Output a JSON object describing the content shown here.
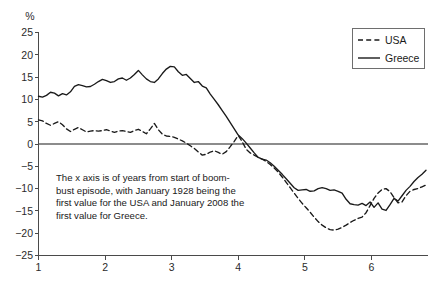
{
  "chart_data": {
    "type": "line",
    "title": "",
    "subtitle": "",
    "xlabel": "",
    "ylabel": "%",
    "unit_label": "%",
    "xlim": [
      1,
      6.85
    ],
    "ylim": [
      -25,
      25
    ],
    "grid": false,
    "zero_line": true,
    "legend_position": "top-right",
    "x_ticks": [
      "1",
      "2",
      "3",
      "4",
      "5",
      "6"
    ],
    "x_tick_values": [
      1,
      2,
      3,
      4,
      5,
      6
    ],
    "y_ticks": [
      "25",
      "20",
      "15",
      "10",
      "5",
      "0",
      "−5",
      "−10",
      "−15",
      "−20",
      "−25"
    ],
    "y_tick_values": [
      25,
      20,
      15,
      10,
      5,
      0,
      -5,
      -10,
      -15,
      -20,
      -25
    ],
    "annotation": "The x axis is of years from start of boom-bust episode, with January 1928 being the first value for the USA and January 2008 the first value for Greece.",
    "annotation_lines": [
      "The x axis is of years from start of boom-",
      "bust episode, with January 1928 being the",
      "first value for the USA and January 2008 the",
      "first value for Greece."
    ],
    "series": [
      {
        "name": "USA",
        "style": "dashed",
        "color": "#1a1a1a",
        "x": [
          1.0,
          1.06,
          1.12,
          1.18,
          1.24,
          1.3,
          1.36,
          1.42,
          1.48,
          1.54,
          1.6,
          1.66,
          1.72,
          1.78,
          1.84,
          1.9,
          1.96,
          2.02,
          2.08,
          2.14,
          2.2,
          2.26,
          2.32,
          2.38,
          2.44,
          2.5,
          2.56,
          2.62,
          2.68,
          2.74,
          2.8,
          2.86,
          2.92,
          2.98,
          3.04,
          3.1,
          3.16,
          3.22,
          3.28,
          3.34,
          3.4,
          3.46,
          3.52,
          3.58,
          3.64,
          3.7,
          3.76,
          3.82,
          3.88,
          3.94,
          4.0,
          4.06,
          4.12,
          4.18,
          4.24,
          4.3,
          4.36,
          4.42,
          4.48,
          4.54,
          4.6,
          4.66,
          4.72,
          4.78,
          4.84,
          4.9,
          4.96,
          5.02,
          5.08,
          5.14,
          5.2,
          5.26,
          5.32,
          5.38,
          5.44,
          5.5,
          5.56,
          5.62,
          5.68,
          5.74,
          5.8,
          5.86,
          5.92,
          5.98,
          6.04,
          6.1,
          6.16,
          6.22,
          6.28,
          6.34,
          6.4,
          6.46,
          6.52,
          6.58,
          6.64,
          6.7,
          6.76,
          6.82
        ],
        "values": [
          5.4,
          5.2,
          4.6,
          4.2,
          4.6,
          5.0,
          4.3,
          3.4,
          2.8,
          3.3,
          3.7,
          3.2,
          2.7,
          2.9,
          3.0,
          2.9,
          3.0,
          3.2,
          2.9,
          2.6,
          2.9,
          3.0,
          2.8,
          2.6,
          3.0,
          3.3,
          2.8,
          2.3,
          3.4,
          4.6,
          3.2,
          2.2,
          1.8,
          1.7,
          1.5,
          1.1,
          0.7,
          0.2,
          -0.4,
          -1.0,
          -1.8,
          -2.5,
          -2.3,
          -1.8,
          -1.5,
          -1.9,
          -2.3,
          -1.7,
          -0.6,
          0.6,
          1.9,
          0.5,
          -1.2,
          -2.0,
          -2.5,
          -3.0,
          -3.4,
          -3.9,
          -4.6,
          -5.4,
          -6.3,
          -7.4,
          -8.6,
          -9.8,
          -11.0,
          -12.2,
          -13.3,
          -14.3,
          -15.3,
          -16.4,
          -17.4,
          -18.2,
          -18.8,
          -19.2,
          -19.3,
          -19.1,
          -18.7,
          -18.2,
          -17.6,
          -17.1,
          -16.7,
          -16.4,
          -15.4,
          -13.8,
          -12.2,
          -11.0,
          -10.2,
          -10.0,
          -10.7,
          -12.0,
          -13.2,
          -13.0,
          -11.6,
          -10.6,
          -10.2,
          -10.0,
          -9.6,
          -9.2
        ]
      },
      {
        "name": "Greece",
        "style": "solid",
        "color": "#1a1a1a",
        "x": [
          1.0,
          1.06,
          1.12,
          1.18,
          1.24,
          1.3,
          1.36,
          1.42,
          1.48,
          1.54,
          1.6,
          1.66,
          1.72,
          1.78,
          1.84,
          1.9,
          1.96,
          2.02,
          2.08,
          2.14,
          2.2,
          2.26,
          2.32,
          2.38,
          2.44,
          2.5,
          2.56,
          2.62,
          2.68,
          2.74,
          2.8,
          2.86,
          2.92,
          2.98,
          3.04,
          3.1,
          3.16,
          3.22,
          3.28,
          3.34,
          3.4,
          3.46,
          3.52,
          3.58,
          3.64,
          3.7,
          3.76,
          3.82,
          3.88,
          3.94,
          4.0,
          4.06,
          4.12,
          4.18,
          4.24,
          4.3,
          4.36,
          4.42,
          4.48,
          4.54,
          4.6,
          4.66,
          4.72,
          4.78,
          4.84,
          4.9,
          4.96,
          5.02,
          5.08,
          5.14,
          5.2,
          5.26,
          5.32,
          5.38,
          5.44,
          5.5,
          5.56,
          5.62,
          5.68,
          5.74,
          5.8,
          5.86,
          5.92,
          5.98,
          6.04,
          6.1,
          6.16,
          6.22,
          6.28,
          6.34,
          6.4,
          6.46,
          6.52,
          6.58,
          6.64,
          6.7,
          6.76,
          6.82
        ],
        "values": [
          10.7,
          10.5,
          10.9,
          11.6,
          11.4,
          10.8,
          11.3,
          11.0,
          11.7,
          12.9,
          13.3,
          13.1,
          12.8,
          12.9,
          13.4,
          14.0,
          14.5,
          14.2,
          13.8,
          14.0,
          14.6,
          14.8,
          14.3,
          14.8,
          15.6,
          16.5,
          15.5,
          14.6,
          14.0,
          13.8,
          14.6,
          15.8,
          16.8,
          17.4,
          17.3,
          16.2,
          15.4,
          15.6,
          14.7,
          13.8,
          14.0,
          13.0,
          12.6,
          11.2,
          10.0,
          8.8,
          7.5,
          6.2,
          4.8,
          3.4,
          2.0,
          1.2,
          0.2,
          -0.9,
          -2.0,
          -3.0,
          -3.4,
          -3.6,
          -4.2,
          -5.0,
          -5.9,
          -6.8,
          -7.8,
          -8.8,
          -9.8,
          -10.4,
          -10.3,
          -10.2,
          -10.6,
          -10.5,
          -10.0,
          -9.8,
          -10.0,
          -10.4,
          -10.3,
          -10.6,
          -11.0,
          -12.4,
          -13.4,
          -13.6,
          -13.7,
          -13.3,
          -13.8,
          -13.0,
          -14.2,
          -13.2,
          -14.6,
          -14.9,
          -13.6,
          -12.2,
          -12.8,
          -11.6,
          -10.4,
          -9.5,
          -8.4,
          -7.5,
          -6.8,
          -5.9
        ]
      }
    ]
  },
  "legend": {
    "items": [
      {
        "label": "USA",
        "style": "dashed"
      },
      {
        "label": "Greece",
        "style": "solid"
      }
    ]
  }
}
